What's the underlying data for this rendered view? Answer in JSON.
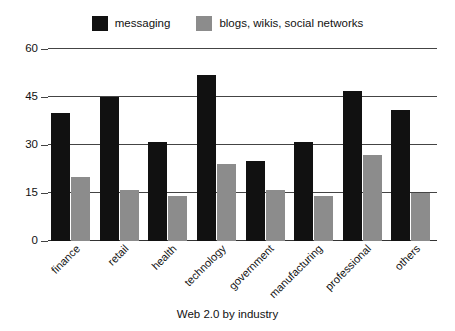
{
  "caption": "Web 2.0 by industry",
  "legend": {
    "position": "top-center",
    "entries": [
      {
        "label": "messaging",
        "color": "#111111",
        "swatch_name": "legend-swatch-messaging"
      },
      {
        "label": "blogs, wikis, social networks",
        "color": "#8c8c8c",
        "swatch_name": "legend-swatch-blogs"
      }
    ]
  },
  "axis": {
    "yticks": [
      "0",
      "15",
      "30",
      "45",
      "60"
    ]
  },
  "chart_data": {
    "type": "bar",
    "title": "Web 2.0 by industry",
    "xlabel": "",
    "ylabel": "",
    "ylim": [
      0,
      60
    ],
    "ytick_values": [
      0,
      15,
      30,
      45,
      60
    ],
    "grid": true,
    "legend_position": "top-center",
    "categories": [
      "finance",
      "retail",
      "health",
      "technology",
      "government",
      "manufacturing",
      "professional",
      "others"
    ],
    "series": [
      {
        "name": "messaging",
        "color": "#111111",
        "values": [
          40,
          45,
          31,
          52,
          25,
          31,
          47,
          41
        ]
      },
      {
        "name": "blogs, wikis, social networks",
        "color": "#8c8c8c",
        "values": [
          20,
          16,
          14,
          24,
          16,
          14,
          27,
          15
        ]
      }
    ]
  }
}
